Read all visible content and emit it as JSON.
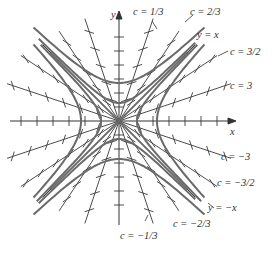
{
  "diagram": {
    "type": "direction-field-isoclines",
    "axes": {
      "x_label": "x",
      "y_label": "y"
    },
    "center": {
      "x": 119,
      "y": 121
    },
    "isoclines": [
      {
        "c_label": "c = 1/3",
        "slope": 3.0
      },
      {
        "c_label": "c = 2/3",
        "slope": 1.5
      },
      {
        "c_label": "y = x",
        "slope": 1.0
      },
      {
        "c_label": "c = 3/2",
        "slope": 0.6667
      },
      {
        "c_label": "c = 3",
        "slope": 0.3333
      },
      {
        "c_label": "c = -3",
        "slope": -0.3333
      },
      {
        "c_label": "c = -3/2",
        "slope": -0.6667
      },
      {
        "c_label": "y = -x",
        "slope": -1.0
      },
      {
        "c_label": "c = -2/3",
        "slope": -1.5
      },
      {
        "c_label": "c = -1/3",
        "slope": -3.0
      }
    ],
    "labels": {
      "y_axis": "y",
      "x_axis": "x",
      "c_1_3": "c = 1/3",
      "c_2_3": "c = 2/3",
      "y_eq_x": "y = x",
      "c_3_2": "c = 3/2",
      "c_3": "c = 3",
      "c_neg_3": "c = −3",
      "c_neg_3_2": "c = −3/2",
      "y_eq_neg_x": "y = −x",
      "c_neg_2_3": "c = −2/3",
      "c_neg_1_3": "c = −1/3"
    },
    "colors": {
      "line": "#333333",
      "curve": "#555555",
      "background": "#ffffff"
    }
  }
}
